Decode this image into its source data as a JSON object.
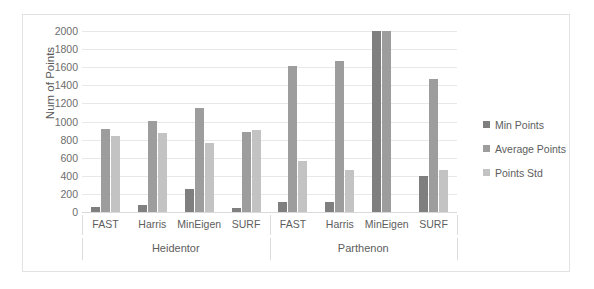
{
  "chart_data": {
    "type": "bar",
    "title": "",
    "xlabel": "",
    "ylabel": "Num of Points",
    "ylim": [
      0,
      2000
    ],
    "ytick_step": 200,
    "yticks": [
      "2000",
      "1800",
      "1600",
      "1400",
      "1200",
      "1000",
      "800",
      "600",
      "400",
      "200",
      "0"
    ],
    "grid": true,
    "legend_position": "right",
    "group_labels": [
      "Heidentor",
      "Parthenon"
    ],
    "categories": [
      "FAST",
      "Harris",
      "MinEigen",
      "SURF",
      "FAST",
      "Harris",
      "MinEigen",
      "SURF"
    ],
    "series": [
      {
        "name": "Min Points",
        "color": "#7f7f7f",
        "values": [
          50,
          80,
          250,
          45,
          110,
          105,
          2000,
          400
        ]
      },
      {
        "name": "Average Points",
        "color": "#9d9d9d",
        "values": [
          920,
          1010,
          1145,
          885,
          1615,
          1670,
          2000,
          1470
        ]
      },
      {
        "name": "Points Std",
        "color": "#c3c3c3",
        "values": [
          845,
          870,
          760,
          910,
          560,
          465,
          0,
          465
        ]
      }
    ]
  },
  "legend": {
    "items": [
      {
        "label": "Min Points"
      },
      {
        "label": "Average Points"
      },
      {
        "label": "Points Std"
      }
    ]
  }
}
